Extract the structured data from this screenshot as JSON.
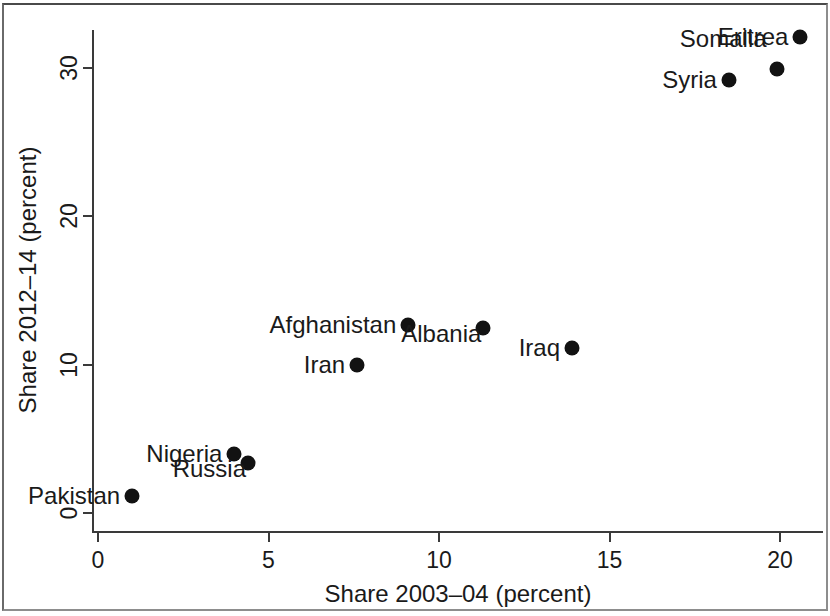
{
  "chart_data": {
    "type": "scatter",
    "title": "",
    "xlabel": "Share 2003–04 (percent)",
    "ylabel": "Share 2012–14 (percent)",
    "xlim": [
      -0.4,
      21.4
    ],
    "ylim": [
      -0.9,
      33.4
    ],
    "xticks": [
      0,
      5,
      10,
      15,
      20
    ],
    "xticklabels": [
      "0",
      "5",
      "10",
      "15",
      "20"
    ],
    "yticks": [
      0,
      10,
      20,
      30
    ],
    "yticklabels": [
      "0",
      "10",
      "20",
      "30"
    ],
    "grid": false,
    "legend": null,
    "marker_color": "#121212",
    "axis_color": "#3a3a3a",
    "points": [
      {
        "label": "Eritrea",
        "x": 20.6,
        "y": 32.1,
        "label_pos": "left"
      },
      {
        "label": "Somalia",
        "x": 19.9,
        "y": 29.9,
        "label_pos": "upper-left"
      },
      {
        "label": "Syria",
        "x": 18.5,
        "y": 29.2,
        "label_pos": "left"
      },
      {
        "label": "Afghanistan",
        "x": 9.1,
        "y": 12.7,
        "label_pos": "left"
      },
      {
        "label": "Albania",
        "x": 11.3,
        "y": 12.5,
        "label_pos": "below-left"
      },
      {
        "label": "Iraq",
        "x": 13.9,
        "y": 11.1,
        "label_pos": "left"
      },
      {
        "label": "Iran",
        "x": 7.6,
        "y": 10.0,
        "label_pos": "left"
      },
      {
        "label": "Nigeria",
        "x": 4.0,
        "y": 4.0,
        "label_pos": "left"
      },
      {
        "label": "Russia",
        "x": 4.4,
        "y": 3.4,
        "label_pos": "below-left"
      },
      {
        "label": "Pakistan",
        "x": 1.0,
        "y": 1.15,
        "label_pos": "left"
      }
    ]
  }
}
